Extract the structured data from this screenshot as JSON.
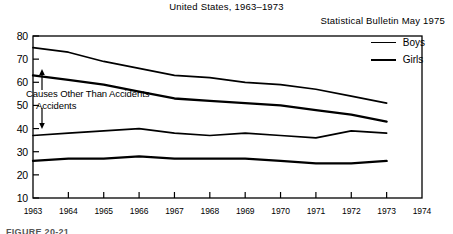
{
  "header": {
    "title": "United States, 1963–1973",
    "subtitle": "Statistical Bulletin May 1975"
  },
  "caption": "FIGURE 20-21",
  "annotations": {
    "upper": "Causes Other Than Accidents",
    "lower": "Accidents"
  },
  "legend": {
    "items": [
      {
        "label": "Boys",
        "style": "thin"
      },
      {
        "label": "Girls",
        "style": "thick"
      }
    ]
  },
  "chart_data": {
    "type": "line",
    "title": "United States, 1963–1973",
    "subtitle": "Statistical Bulletin May 1975",
    "xlabel": "",
    "ylabel": "",
    "xlim": [
      1963,
      1974
    ],
    "ylim": [
      10,
      80
    ],
    "yticks": [
      10,
      20,
      30,
      40,
      50,
      60,
      70,
      80
    ],
    "xticks": [
      1963,
      1964,
      1965,
      1966,
      1967,
      1968,
      1969,
      1970,
      1971,
      1972,
      1973,
      1974
    ],
    "grid": false,
    "legend_position": "top-right",
    "x": [
      1963,
      1964,
      1965,
      1966,
      1967,
      1968,
      1969,
      1970,
      1971,
      1972,
      1973
    ],
    "series": [
      {
        "name": "Boys — Causes Other Than Accidents",
        "group": "Boys",
        "cause": "Causes Other Than Accidents",
        "values": [
          75,
          73,
          69,
          66,
          63,
          62,
          60,
          59,
          57,
          54,
          51
        ]
      },
      {
        "name": "Girls — Causes Other Than Accidents",
        "group": "Girls",
        "cause": "Causes Other Than Accidents",
        "values": [
          63,
          61,
          59,
          56,
          53,
          52,
          51,
          50,
          48,
          46,
          43
        ]
      },
      {
        "name": "Boys — Accidents",
        "group": "Boys",
        "cause": "Accidents",
        "values": [
          37,
          38,
          39,
          40,
          38,
          37,
          38,
          37,
          36,
          39,
          38
        ]
      },
      {
        "name": "Girls — Accidents",
        "group": "Girls",
        "cause": "Accidents",
        "values": [
          26,
          27,
          27,
          28,
          27,
          27,
          27,
          26,
          25,
          25,
          26
        ]
      }
    ]
  },
  "axes": {
    "y_labels": [
      "80",
      "70",
      "60",
      "50",
      "40",
      "30",
      "20",
      "10"
    ],
    "x_labels": [
      "1963",
      "1964",
      "1965",
      "1966",
      "1967",
      "1968",
      "1969",
      "1970",
      "1971",
      "1972",
      "1973",
      "1974"
    ]
  }
}
